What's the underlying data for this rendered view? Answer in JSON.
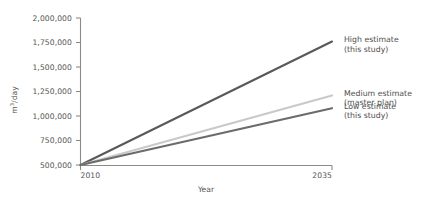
{
  "chart_data": {
    "type": "line",
    "title": "",
    "xlabel": "Year",
    "ylabel": "m3/day",
    "ylabel_main": "m",
    "ylabel_sup": "3",
    "ylabel_rest": "/day",
    "x": [
      2010,
      2035
    ],
    "xlim": [
      2010,
      2035
    ],
    "ylim": [
      500000,
      2000000
    ],
    "xticks": [
      2010,
      2035
    ],
    "xtick_labels": [
      "2010",
      "2035"
    ],
    "yticks": [
      500000,
      750000,
      1000000,
      1250000,
      1500000,
      1750000,
      2000000
    ],
    "ytick_labels": [
      "500,000",
      "750,000",
      "1,000,000",
      "1,250,000",
      "1,500,000",
      "1,750,000",
      "2,000,000"
    ],
    "grid": false,
    "legend_position": "right-inline",
    "series": [
      {
        "name": "High estimate (this study)",
        "label_line1": "High estimate",
        "label_line2": "(this study)",
        "values": [
          500000,
          1760000
        ],
        "color": "#595959",
        "width": 2.1
      },
      {
        "name": "Medium estimate (master plan)",
        "label_line1": "Medium estimate",
        "label_line2": "(master plan)",
        "values": [
          500000,
          1210000
        ],
        "color": "#c9c9c9",
        "width": 2.1
      },
      {
        "name": "Low estimate (this study)",
        "label_line1": "Low estimate",
        "label_line2": "(this study)",
        "values": [
          500000,
          1080000
        ],
        "color": "#6b6b6b",
        "width": 2.1
      }
    ],
    "axis_color": "#8a8a8a"
  },
  "axes": {
    "y_title_full": "m3/day",
    "x_title": "Year"
  }
}
